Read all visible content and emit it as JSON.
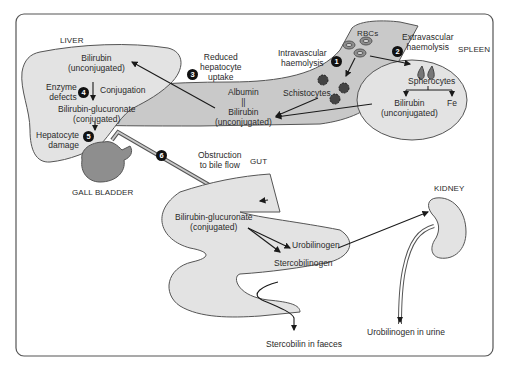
{
  "diagram": {
    "organs": {
      "liver": "LIVER",
      "spleen": "SPLEEN",
      "gut": "GUT",
      "kidney": "KIDNEY",
      "gall_bladder": "GALL BLADDER",
      "rbcs": "RBCs"
    },
    "liver": {
      "bilirubin": "Bilirubin",
      "unconjugated": "(unconjugated)",
      "conjugation": "Conjugation",
      "bil_gluc": "Bilirubin-glucuronate",
      "conjugated": "(conjugated)"
    },
    "causes": {
      "c1": {
        "num": "1",
        "line1": "Intravascular",
        "line2": "haemolysis"
      },
      "c2": {
        "num": "2",
        "line1": "Extravascular",
        "line2": "haemolysis"
      },
      "c3": {
        "num": "3",
        "line1": "Reduced",
        "line2": "hepatocyte",
        "line3": "uptake"
      },
      "c4": {
        "num": "4",
        "line1": "Enzyme",
        "line2": "defects"
      },
      "c5": {
        "num": "5",
        "line1": "Hepatocyte",
        "line2": "damage"
      },
      "c6": {
        "num": "6",
        "line1": "Obstruction",
        "line2": "to bile flow"
      }
    },
    "blood": {
      "albumin": "Albumin",
      "bond": "||",
      "bilirubin": "Bilirubin",
      "unconjugated": "(unconjugated)",
      "schistocytes": "Schistocytes"
    },
    "spleen": {
      "spherocytes": "Spherocytes",
      "bilirubin": "Bilirubin",
      "unconjugated": "(unconjugated)",
      "fe": "Fe"
    },
    "gut": {
      "bil_gluc": "Bilirubin-glucuronate",
      "conjugated": "(conjugated)",
      "urobilinogen": "Urobilinogen",
      "stercobilinogen": "Stercobilinogen",
      "stercobilin_faeces": "Stercobilin in faeces"
    },
    "kidney": {
      "urobilinogen_urine": "Urobilinogen in urine"
    },
    "colors": {
      "organ_fill": "#e3e3e3",
      "vessel_fill": "#c9c9c9",
      "gallbladder_fill": "#8e8e8e",
      "outline": "#555555",
      "arrow": "#1a1a1a"
    }
  }
}
